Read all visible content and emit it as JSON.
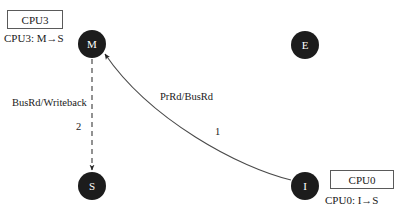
{
  "diagram": {
    "title_hidden": "",
    "stroke_color": "#3c3c3c",
    "node_fill": "#1c1c1c",
    "node_text_color": "#ffffff",
    "nodes": [
      {
        "id": "M",
        "label": "M",
        "cx": 92,
        "cy": 44
      },
      {
        "id": "E",
        "label": "E",
        "cx": 305,
        "cy": 45
      },
      {
        "id": "S",
        "label": "S",
        "cx": 92,
        "cy": 186
      },
      {
        "id": "I",
        "label": "I",
        "cx": 305,
        "cy": 186
      }
    ],
    "boxes": [
      {
        "id": "cpu3",
        "label": "CPU3",
        "x": 7,
        "y": 10,
        "w": 56,
        "h": 19
      },
      {
        "id": "cpu0",
        "label": "CPU0",
        "x": 330,
        "y": 170,
        "w": 64,
        "h": 19
      }
    ],
    "notes": [
      {
        "id": "cpu3-transition",
        "text": "CPU3:  M→S",
        "x": 4,
        "y": 32
      },
      {
        "id": "cpu0-transition",
        "text": "CPU0:  I→S",
        "x": 325,
        "y": 194
      }
    ],
    "edges": [
      {
        "id": "m-to-s",
        "from": "M",
        "to": "S",
        "style": "dashed",
        "label": "BusRd/Writeback",
        "label_x": 12,
        "label_y": 97,
        "step": "2",
        "step_x": 76,
        "step_y": 121
      },
      {
        "id": "i-to-m",
        "from": "I",
        "to": "M",
        "style": "solid-curved",
        "label": "PrRd/BusRd",
        "label_x": 160,
        "label_y": 91,
        "step": "1",
        "step_x": 215,
        "step_y": 126
      }
    ]
  }
}
